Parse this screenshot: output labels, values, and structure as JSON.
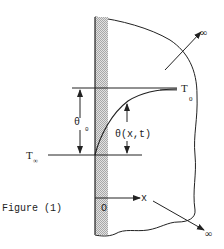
{
  "figure": {
    "caption": "Figure (1)",
    "type": "semi-infinite solid with transient temperature profile"
  },
  "labels": {
    "T_surface": "T",
    "T_surface_sub": "0",
    "T_ambient": "T",
    "T_ambient_sub": "∞",
    "theta_0": "θ",
    "theta_0_sub": "0",
    "theta_xt": "θ(x,t)",
    "origin": "O",
    "x_axis": "x",
    "infinity_upper": "∞",
    "infinity_lower": "∞"
  },
  "colors": {
    "line": "#222222",
    "wall_hatch": "#bdbdbd",
    "background": "#ffffff"
  }
}
